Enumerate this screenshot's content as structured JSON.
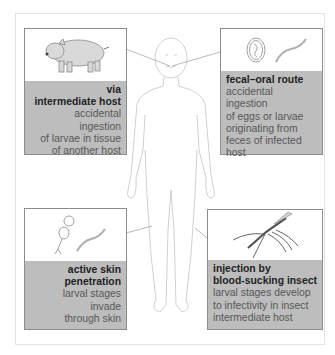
{
  "figure": {
    "type": "infection routes diagram",
    "center_figure": "human-body-outline"
  },
  "boxes": [
    {
      "id": "intermediate-host",
      "position": "top-left",
      "icon": "pig-icon",
      "title_line1": "via",
      "title_line2": "intermediate host",
      "desc_line1": "accidental ingestion",
      "desc_line2": "of larvae in tissue",
      "desc_line3": "of another host",
      "points_to": "mouth"
    },
    {
      "id": "fecal-oral",
      "position": "top-right",
      "icon": "egg-and-larva-icon",
      "title_line1": "fecal–oral route",
      "desc_line1": "accidental ingestion",
      "desc_line2": "of eggs or larvae",
      "desc_line3": "originating from",
      "desc_line4": "feces of infected",
      "desc_line5": "host",
      "points_to": "mouth"
    },
    {
      "id": "skin-penetration",
      "position": "bottom-left",
      "icon": "cercaria-and-larva-icon",
      "title_line1": "active skin",
      "title_line2": "penetration",
      "desc_line1": "larval stages",
      "desc_line2": "invade",
      "desc_line3": "through skin",
      "points_to": "leg"
    },
    {
      "id": "insect-injection",
      "position": "bottom-right",
      "icon": "mosquito-icon",
      "title_line1": "injection by",
      "title_line2": "blood-sucking insect",
      "desc_line1": "larval stages develop",
      "desc_line2": "to infectivity in insect",
      "desc_line3": "intermediate host",
      "points_to": "leg"
    }
  ],
  "colors": {
    "caption_bg": "#bdbdbd",
    "title_text": "#1f1f1f",
    "desc_text": "#575757",
    "box_border": "#8c8c8c",
    "line": "#a8a8a8"
  }
}
